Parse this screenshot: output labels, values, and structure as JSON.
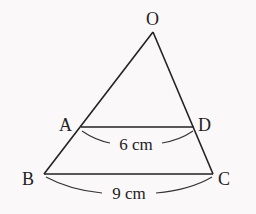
{
  "diagram": {
    "type": "geometry-triangle-with-parallel-segment",
    "points": {
      "O": {
        "label": "O",
        "x": 153,
        "y": 32
      },
      "A": {
        "label": "A",
        "x": 81,
        "y": 127
      },
      "D": {
        "label": "D",
        "x": 194,
        "y": 127
      },
      "B": {
        "label": "B",
        "x": 44,
        "y": 174
      },
      "C": {
        "label": "C",
        "x": 213,
        "y": 174
      }
    },
    "segments": [
      "OB",
      "OC",
      "AD",
      "BC"
    ],
    "measurements": {
      "AD": "6 cm",
      "BC": "9 cm"
    }
  }
}
